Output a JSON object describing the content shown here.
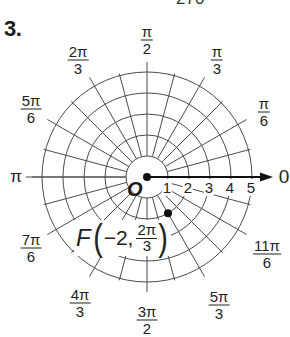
{
  "problem": {
    "number": "3.",
    "cut_off_text_top": "270"
  },
  "chart_data": {
    "type": "polar_grid",
    "title": "",
    "pole": {
      "label": "O"
    },
    "polar_axis": {
      "label": "0",
      "ticks": [
        "1",
        "2",
        "3",
        "4",
        "5"
      ],
      "arrow": true
    },
    "rings": [
      1,
      2,
      3,
      4,
      5
    ],
    "radial_line_step_degrees": 15,
    "angle_labels": [
      {
        "angle_deg": 0,
        "text": "0",
        "kind": "plain"
      },
      {
        "angle_deg": 30,
        "num": "π",
        "den": "6",
        "kind": "fraction"
      },
      {
        "angle_deg": 60,
        "num": "π",
        "den": "3",
        "kind": "fraction"
      },
      {
        "angle_deg": 90,
        "num": "π",
        "den": "2",
        "kind": "fraction"
      },
      {
        "angle_deg": 120,
        "num": "2π",
        "den": "3",
        "kind": "fraction"
      },
      {
        "angle_deg": 150,
        "num": "5π",
        "den": "6",
        "kind": "fraction"
      },
      {
        "angle_deg": 180,
        "text": "π",
        "kind": "plain"
      },
      {
        "angle_deg": 210,
        "num": "7π",
        "den": "6",
        "kind": "fraction"
      },
      {
        "angle_deg": 240,
        "num": "4π",
        "den": "3",
        "kind": "fraction"
      },
      {
        "angle_deg": 270,
        "num": "3π",
        "den": "2",
        "kind": "fraction"
      },
      {
        "angle_deg": 300,
        "num": "5π",
        "den": "3",
        "kind": "fraction"
      },
      {
        "angle_deg": 330,
        "num": "11π",
        "den": "6",
        "kind": "fraction"
      }
    ],
    "points": [
      {
        "name": "F",
        "r": -2,
        "theta_label_num": "2π",
        "theta_label_den": "3",
        "theta_deg": 120,
        "coord_text_r": "−2,"
      }
    ]
  },
  "colors": {
    "grid": "#4a4a4a",
    "ink": "#111111",
    "background": "#ffffff"
  }
}
